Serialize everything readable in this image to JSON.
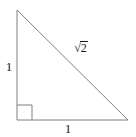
{
  "figure": {
    "name": "right-triangle",
    "background_color": "#ffffff",
    "stroke_color": "#808080",
    "label_color": "#1a1a1a",
    "stroke_width": 1
  },
  "geometry": {
    "vertices": {
      "top_left": {
        "x": 17,
        "y": 10
      },
      "bottom_left": {
        "x": 17,
        "y": 120
      },
      "bottom_right": {
        "x": 128,
        "y": 120
      }
    },
    "right_angle_marker": {
      "at_vertex": "bottom_left",
      "size": 15
    }
  },
  "labels": {
    "vertical_leg": "1",
    "horizontal_leg": "1",
    "hypotenuse_radical": "√",
    "hypotenuse_radicand": "2",
    "hypotenuse_full": "√2"
  }
}
